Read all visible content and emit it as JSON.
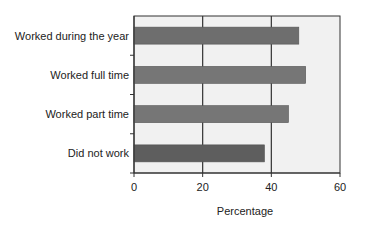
{
  "chart_data": {
    "type": "bar",
    "orientation": "horizontal",
    "title": "",
    "xlabel": "Percentage",
    "ylabel": "",
    "categories": [
      "Worked during the year",
      "Worked full time",
      "Worked part time",
      "Did not work"
    ],
    "values": [
      48,
      50,
      45,
      38
    ],
    "xlim": [
      0,
      60
    ],
    "xticks": [
      0,
      20,
      40,
      60
    ],
    "grid": "vertical lines at x ticks",
    "legend": null,
    "colors": {
      "bars": [
        "#6e6e6e",
        "#767676",
        "#767676",
        "#5e5e5e"
      ],
      "plot_background": "#f1f1f1",
      "grid": "#333333",
      "border": "#333333"
    }
  }
}
